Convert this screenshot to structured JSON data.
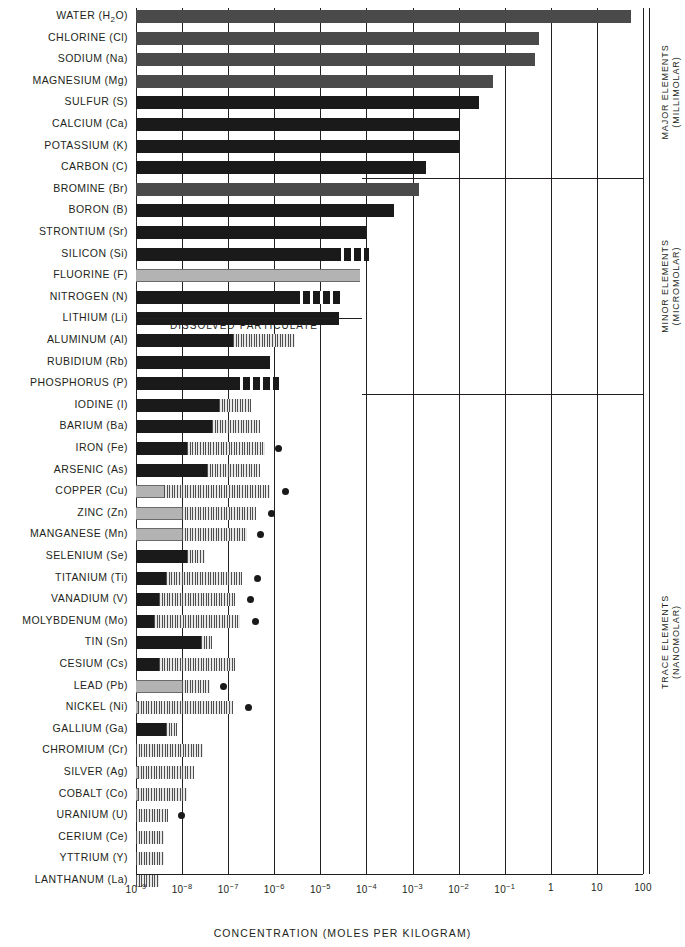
{
  "chart_data": {
    "type": "bar",
    "title": "",
    "xlabel": "CONCENTRATION (MOLES PER KILOGRAM)",
    "ylabel": "",
    "xscale": "log",
    "xlim": [
      1e-09,
      100
    ],
    "xticks": [
      "10⁻⁹",
      "10⁻⁸",
      "10⁻⁷",
      "10⁻⁶",
      "10⁻⁵",
      "10⁻⁴",
      "10⁻³",
      "10⁻²",
      "10⁻¹",
      "1",
      "10",
      "100"
    ],
    "xtick_exponents": [
      -9,
      -8,
      -7,
      -6,
      -5,
      -4,
      -3,
      -2,
      -1,
      0,
      1,
      2
    ],
    "grid": true,
    "legend": [
      "DISSOLVED",
      "PARTICULATE"
    ],
    "legend_position": "inline-middle",
    "series_note": "Each bar spans from the low end of the axis to the element's dissolved concentration (solid fill); the hatched extension marks the particulate range; a filled circle marks the upper observed value.",
    "categories": [
      "WATER (H2O)",
      "CHLORINE (Cl)",
      "SODIUM (Na)",
      "MAGNESIUM (Mg)",
      "SULFUR (S)",
      "CALCIUM (Ca)",
      "POTASSIUM (K)",
      "CARBON (C)",
      "BROMINE (Br)",
      "BORON (B)",
      "STRONTIUM (Sr)",
      "SILICON (Si)",
      "FLUORINE (F)",
      "NITROGEN (N)",
      "LITHIUM (Li)",
      "ALUMINUM (Al)",
      "RUBIDIUM (Rb)",
      "PHOSPHORUS (P)",
      "IODINE (I)",
      "BARIUM (Ba)",
      "IRON (Fe)",
      "ARSENIC (As)",
      "COPPER (Cu)",
      "ZINC (Zn)",
      "MANGANESE (Mn)",
      "SELENIUM (Se)",
      "TITANIUM (Ti)",
      "VANADIUM (V)",
      "MOLYBDENUM (Mo)",
      "TIN (Sn)",
      "CESIUM (Cs)",
      "LEAD (Pb)",
      "NICKEL (Ni)",
      "GALLIUM (Ga)",
      "CHROMIUM (Cr)",
      "SILVER (Ag)",
      "COBALT (Co)",
      "URANIUM (U)",
      "CERIUM (Ce)",
      "YTTRIUM (Y)",
      "LANTHANUM (La)"
    ],
    "group_labels": [
      {
        "name": "MAJOR ELEMENTS",
        "unit": "(MILLIMOLAR)",
        "rows": [
          0,
          7
        ]
      },
      {
        "name": "MINOR ELEMENTS",
        "unit": "(MICROMOLAR)",
        "rows": [
          8,
          17
        ]
      },
      {
        "name": "TRACE ELEMENTS",
        "unit": "(NANOMOLAR)",
        "rows": [
          18,
          40
        ]
      }
    ],
    "rows": [
      {
        "name": "WATER (H2O)",
        "label": "WATER (H<sub>2</sub>O)",
        "dissolved_log": 1.74,
        "fill": "dissolved-mid",
        "part_log": null,
        "dot_log": null
      },
      {
        "name": "CHLORINE (Cl)",
        "label": "CHLORINE (Cl)",
        "dissolved_log": -0.26,
        "fill": "dissolved-mid",
        "part_log": null,
        "dot_log": null
      },
      {
        "name": "SODIUM (Na)",
        "label": "SODIUM (Na)",
        "dissolved_log": -0.35,
        "fill": "dissolved-mid",
        "part_log": null,
        "dot_log": null
      },
      {
        "name": "MAGNESIUM (Mg)",
        "label": "MAGNESIUM (Mg)",
        "dissolved_log": -1.25,
        "fill": "dissolved-mid",
        "part_log": null,
        "dot_log": null
      },
      {
        "name": "SULFUR (S)",
        "label": "SULFUR (S)",
        "dissolved_log": -1.55,
        "fill": "dissolved-dark",
        "part_log": null,
        "dot_log": null
      },
      {
        "name": "CALCIUM (Ca)",
        "label": "CALCIUM (Ca)",
        "dissolved_log": -1.98,
        "fill": "dissolved-dark",
        "part_log": null,
        "dot_log": null
      },
      {
        "name": "POTASSIUM (K)",
        "label": "POTASSIUM (K)",
        "dissolved_log": -2.0,
        "fill": "dissolved-dark",
        "part_log": null,
        "dot_log": null
      },
      {
        "name": "CARBON (C)",
        "label": "CARBON (C)",
        "dissolved_log": -2.7,
        "fill": "dissolved-dark",
        "part_log": null,
        "dot_log": null
      },
      {
        "name": "BROMINE (Br)",
        "label": "BROMINE (Br)",
        "dissolved_log": -2.85,
        "fill": "dissolved-mid",
        "part_log": null,
        "dot_log": null
      },
      {
        "name": "BORON (B)",
        "label": "BORON (B)",
        "dissolved_log": -3.4,
        "fill": "dissolved-dark",
        "part_log": null,
        "dot_log": null
      },
      {
        "name": "STRONTIUM (Sr)",
        "label": "STRONTIUM (Sr)",
        "dissolved_log": -4.0,
        "fill": "dissolved-dark",
        "part_log": null,
        "dot_log": null
      },
      {
        "name": "SILICON (Si)",
        "label": "SILICON (Si)",
        "dissolved_log": -4.7,
        "fill": "dissolved-dark",
        "part_log": -3.95,
        "part_style": "coarse",
        "dot_log": null
      },
      {
        "name": "FLUORINE (F)",
        "label": "FLUORINE (F)",
        "dissolved_log": -4.15,
        "fill": "dissolved-light",
        "part_log": null,
        "dot_log": null
      },
      {
        "name": "NITROGEN (N)",
        "label": "NITROGEN (N)",
        "dissolved_log": -5.6,
        "fill": "dissolved-dark",
        "part_log": -4.55,
        "part_style": "coarse",
        "dot_log": null
      },
      {
        "name": "LITHIUM (Li)",
        "label": "LITHIUM (Li)",
        "dissolved_log": -4.6,
        "fill": "dissolved-dark",
        "part_log": null,
        "dot_log": null
      },
      {
        "name": "ALUMINUM (Al)",
        "label": "ALUMINUM (Al)",
        "dissolved_log": -6.9,
        "fill": "dissolved-dark",
        "part_log": -5.55,
        "part_style": "fine",
        "dot_log": null
      },
      {
        "name": "RUBIDIUM (Rb)",
        "label": "RUBIDIUM (Rb)",
        "dissolved_log": -6.1,
        "fill": "dissolved-dark",
        "part_log": null,
        "dot_log": null
      },
      {
        "name": "PHOSPHORUS (P)",
        "label": "PHOSPHORUS (P)",
        "dissolved_log": -6.9,
        "fill": "dissolved-dark",
        "part_log": -5.9,
        "part_style": "coarse",
        "dot_log": null
      },
      {
        "name": "IODINE (I)",
        "label": "IODINE (I)",
        "dissolved_log": -7.2,
        "fill": "dissolved-dark",
        "part_log": -6.5,
        "part_style": "fine",
        "dot_log": null
      },
      {
        "name": "BARIUM (Ba)",
        "label": "BARIUM (Ba)",
        "dissolved_log": -7.35,
        "fill": "dissolved-dark",
        "part_log": -6.3,
        "part_style": "fine",
        "dot_log": null
      },
      {
        "name": "IRON (Fe)",
        "label": "IRON (Fe)",
        "dissolved_log": -7.9,
        "fill": "dissolved-dark",
        "part_log": -6.2,
        "part_style": "fine",
        "dot_log": -6.05
      },
      {
        "name": "ARSENIC (As)",
        "label": "ARSENIC (As)",
        "dissolved_log": -7.45,
        "fill": "dissolved-dark",
        "part_log": -6.3,
        "part_style": "fine",
        "dot_log": null
      },
      {
        "name": "COPPER (Cu)",
        "label": "COPPER (Cu)",
        "dissolved_log": -8.4,
        "fill": "dissolved-light",
        "part_log": -6.1,
        "part_style": "fine",
        "dot_log": -5.9
      },
      {
        "name": "ZINC (Zn)",
        "label": "ZINC (Zn)",
        "dissolved_log": -8.0,
        "fill": "dissolved-light",
        "part_log": -6.4,
        "part_style": "fine",
        "dot_log": -6.2
      },
      {
        "name": "MANGANESE (Mn)",
        "label": "MANGANESE (Mn)",
        "dissolved_log": -8.0,
        "fill": "dissolved-light",
        "part_log": -6.6,
        "part_style": "fine",
        "dot_log": -6.45
      },
      {
        "name": "SELENIUM (Se)",
        "label": "SELENIUM (Se)",
        "dissolved_log": -7.9,
        "fill": "dissolved-dark",
        "part_log": -7.5,
        "part_style": "fine",
        "dot_log": null
      },
      {
        "name": "TITANIUM (Ti)",
        "label": "TITANIUM (Ti)",
        "dissolved_log": -8.35,
        "fill": "dissolved-dark",
        "part_log": -6.7,
        "part_style": "fine",
        "dot_log": -6.5
      },
      {
        "name": "VANADIUM (V)",
        "label": "VANADIUM (V)",
        "dissolved_log": -8.5,
        "fill": "dissolved-dark",
        "part_log": -6.85,
        "part_style": "fine",
        "dot_log": -6.65
      },
      {
        "name": "MOLYBDENUM (Mo)",
        "label": "MOLYBDENUM (Mo)",
        "dissolved_log": -8.6,
        "fill": "dissolved-dark",
        "part_log": -6.75,
        "part_style": "fine",
        "dot_log": -6.55
      },
      {
        "name": "TIN (Sn)",
        "label": "TIN (Sn)",
        "dissolved_log": -7.6,
        "fill": "dissolved-dark",
        "part_log": -7.35,
        "part_style": "fine",
        "dot_log": null
      },
      {
        "name": "CESIUM (Cs)",
        "label": "CESIUM (Cs)",
        "dissolved_log": -8.5,
        "fill": "dissolved-dark",
        "part_log": -6.85,
        "part_style": "fine",
        "dot_log": null
      },
      {
        "name": "LEAD (Pb)",
        "label": "LEAD (Pb)",
        "dissolved_log": -8.0,
        "fill": "dissolved-light",
        "part_log": -7.4,
        "part_style": "fine",
        "dot_log": -7.25
      },
      {
        "name": "NICKEL (Ni)",
        "label": "NICKEL (Ni)",
        "dissolved_log": -8.95,
        "fill": "dissolved-light",
        "part_log": -6.9,
        "part_style": "fine",
        "dot_log": -6.7
      },
      {
        "name": "GALLIUM (Ga)",
        "label": "GALLIUM (Ga)",
        "dissolved_log": -8.35,
        "fill": "dissolved-dark",
        "part_log": -8.1,
        "part_style": "fine",
        "dot_log": null
      },
      {
        "name": "CHROMIUM (Cr)",
        "label": "CHROMIUM (Cr)",
        "dissolved_log": null,
        "fill": "none",
        "part_log": -7.55,
        "part_style": "fine",
        "dot_log": null
      },
      {
        "name": "SILVER (Ag)",
        "label": "SILVER (Ag)",
        "dissolved_log": -8.95,
        "fill": "dissolved-light",
        "part_log": -7.75,
        "part_style": "fine",
        "dot_log": null
      },
      {
        "name": "COBALT (Co)",
        "label": "COBALT (Co)",
        "dissolved_log": -8.95,
        "fill": "dissolved-light",
        "part_log": -7.9,
        "part_style": "fine",
        "dot_log": null
      },
      {
        "name": "URANIUM (U)",
        "label": "URANIUM (U)",
        "dissolved_log": null,
        "fill": "none",
        "part_log": -8.3,
        "part_style": "fine",
        "dot_log": -8.15
      },
      {
        "name": "CERIUM (Ce)",
        "label": "CERIUM (Ce)",
        "dissolved_log": null,
        "fill": "none",
        "part_log": -8.4,
        "part_style": "fine",
        "dot_log": null
      },
      {
        "name": "YTTRIUM (Y)",
        "label": "YTTRIUM (Y)",
        "dissolved_log": null,
        "fill": "none",
        "part_log": -8.4,
        "part_style": "fine",
        "dot_log": null
      },
      {
        "name": "LANTHANUM (La)",
        "label": "LANTHANUM (La)",
        "dissolved_log": null,
        "fill": "none",
        "part_log": -8.5,
        "part_style": "fine",
        "dot_log": null
      }
    ]
  }
}
